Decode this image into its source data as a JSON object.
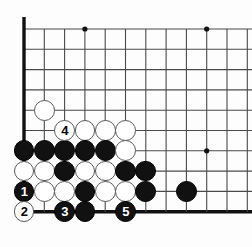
{
  "figure": {
    "name": "go-board-diagram",
    "kind": "go-game-diagram",
    "corner": "bottom-left",
    "background_color": "#fdfdfd",
    "line_color": "#4a4a4a",
    "edge_line_color": "#111111",
    "black_stone_color": "#111111",
    "white_stone_color": "#ffffff",
    "white_stone_border_color": "#5a5a5a",
    "black_label_color": "#ffffff",
    "white_label_color": "#000000"
  },
  "geometry": {
    "width": 252,
    "height": 247,
    "spacing": 20.3,
    "origin_x": 24,
    "origin_y": 29,
    "cols": 12,
    "rows": 10,
    "stone_radius": 10.4,
    "edge_left_x": 24,
    "edge_bottom_y": 218
  },
  "star_points": [
    {
      "name": "star-point-top-left",
      "col": 3,
      "row": 0
    },
    {
      "name": "star-point-top-right",
      "col": 9,
      "row": 0
    },
    {
      "name": "star-point-right",
      "col": 9,
      "row": 6
    }
  ],
  "stones": [
    {
      "name": "white-stone-approach",
      "color": "white",
      "col": 1,
      "row": 4,
      "label": ""
    },
    {
      "name": "white-stone-move-4",
      "color": "white",
      "col": 2,
      "row": 5,
      "label": "4"
    },
    {
      "name": "white-stone-r5-c3",
      "color": "white",
      "col": 3,
      "row": 5,
      "label": ""
    },
    {
      "name": "white-stone-r5-c4",
      "color": "white",
      "col": 4,
      "row": 5,
      "label": ""
    },
    {
      "name": "white-stone-r5-c5",
      "color": "white",
      "col": 5,
      "row": 5,
      "label": ""
    },
    {
      "name": "black-stone-r6-c0",
      "color": "black",
      "col": 0,
      "row": 6,
      "label": ""
    },
    {
      "name": "black-stone-r6-c1",
      "color": "black",
      "col": 1,
      "row": 6,
      "label": ""
    },
    {
      "name": "black-stone-r6-c2",
      "color": "black",
      "col": 2,
      "row": 6,
      "label": ""
    },
    {
      "name": "black-stone-r6-c3",
      "color": "black",
      "col": 3,
      "row": 6,
      "label": ""
    },
    {
      "name": "black-stone-r6-c4",
      "color": "black",
      "col": 4,
      "row": 6,
      "label": ""
    },
    {
      "name": "white-stone-r6-c5",
      "color": "white",
      "col": 5,
      "row": 6,
      "label": ""
    },
    {
      "name": "white-stone-r7-c0",
      "color": "white",
      "col": 0,
      "row": 7,
      "label": ""
    },
    {
      "name": "white-stone-r7-c1",
      "color": "white",
      "col": 1,
      "row": 7,
      "label": ""
    },
    {
      "name": "black-stone-r7-c2",
      "color": "black",
      "col": 2,
      "row": 7,
      "label": ""
    },
    {
      "name": "white-stone-r7-c3",
      "color": "white",
      "col": 3,
      "row": 7,
      "label": ""
    },
    {
      "name": "white-stone-r7-c4",
      "color": "white",
      "col": 4,
      "row": 7,
      "label": ""
    },
    {
      "name": "black-stone-r7-c5",
      "color": "black",
      "col": 5,
      "row": 7,
      "label": ""
    },
    {
      "name": "black-stone-r7-c6",
      "color": "black",
      "col": 6,
      "row": 7,
      "label": ""
    },
    {
      "name": "black-stone-move-1",
      "color": "black",
      "col": 0,
      "row": 8,
      "label": "1"
    },
    {
      "name": "white-stone-r8-c1",
      "color": "white",
      "col": 1,
      "row": 8,
      "label": ""
    },
    {
      "name": "white-stone-r8-c2",
      "color": "white",
      "col": 2,
      "row": 8,
      "label": ""
    },
    {
      "name": "black-stone-r8-c3",
      "color": "black",
      "col": 3,
      "row": 8,
      "label": ""
    },
    {
      "name": "white-stone-r8-c4",
      "color": "white",
      "col": 4,
      "row": 8,
      "label": ""
    },
    {
      "name": "white-stone-r8-c5",
      "color": "white",
      "col": 5,
      "row": 8,
      "label": ""
    },
    {
      "name": "black-stone-r8-c6",
      "color": "black",
      "col": 6,
      "row": 8,
      "label": ""
    },
    {
      "name": "black-stone-r8-c8",
      "color": "black",
      "col": 8,
      "row": 8,
      "label": ""
    },
    {
      "name": "white-stone-move-2",
      "color": "white",
      "col": 0,
      "row": 9,
      "label": "2"
    },
    {
      "name": "black-stone-move-3",
      "color": "black",
      "col": 2,
      "row": 9,
      "label": "3"
    },
    {
      "name": "black-stone-r9-c3",
      "color": "black",
      "col": 3,
      "row": 9,
      "label": ""
    },
    {
      "name": "black-stone-move-5",
      "color": "black",
      "col": 5,
      "row": 9,
      "label": "5"
    }
  ]
}
